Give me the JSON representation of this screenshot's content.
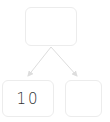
{
  "tree": {
    "root": {
      "label": ""
    },
    "children": [
      {
        "label": "10"
      },
      {
        "label": ""
      }
    ]
  },
  "colors": {
    "node_border": "#ececec",
    "edge": "#dddddd",
    "text": "#333333"
  }
}
